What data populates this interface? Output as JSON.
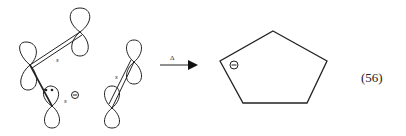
{
  "figure": {
    "equation_number": "(56)",
    "reactant": {
      "description": "p-orbital diagram of pentadienyl anion fragments with sigma bonds",
      "bond_labels": [
        "s",
        "s",
        "s"
      ],
      "lone_pair": "••",
      "charge": "⊖"
    },
    "arrow": {
      "label": "Δ"
    },
    "product": {
      "description": "cyclopentadienyl anion (pentagon)",
      "charge": "⊖"
    }
  }
}
